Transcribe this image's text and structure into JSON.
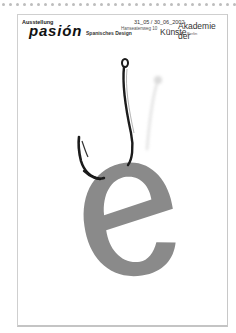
{
  "page": {
    "background": "#ffffff",
    "dot_row": {
      "count": 34,
      "spacing_px": 7,
      "color": "#bdbdbd"
    }
  },
  "poster": {
    "label": "Ausstellung",
    "title": "pasión",
    "subtitle": "Spanisches Design",
    "dates": "31_05 / 30_06_2002",
    "address": "Hanseatenweg 10",
    "venue_line1": "Akademie der",
    "venue_line2": "Künste",
    "city": "Berlin",
    "artwork": {
      "letter": "e",
      "letter_color": "#8a8a8a",
      "hook_color": "#1a1a1a",
      "description": "fish-hook piercing a gray lowercase letter e"
    }
  }
}
